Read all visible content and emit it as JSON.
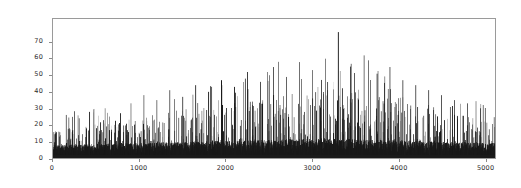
{
  "chart_data": {
    "type": "bar",
    "title": "",
    "xlabel": "",
    "ylabel": "",
    "xlim": [
      0,
      5120
    ],
    "ylim": [
      0,
      84
    ],
    "grid": false,
    "legend": null,
    "series_color": "#1a1a1a",
    "frame_color": "#9a9a9a",
    "background": "#ffffff",
    "xticks": [
      0,
      1000,
      2000,
      3000,
      4000,
      5000
    ],
    "xtick_labels": [
      "0",
      "1000",
      "2000",
      "3000",
      "4000",
      "5000"
    ],
    "yticks": [
      0,
      10,
      20,
      30,
      40,
      50,
      60,
      70
    ],
    "ytick_labels": [
      "0",
      "10",
      "20",
      "30",
      "40",
      "50",
      "60",
      "70"
    ],
    "n_points": 5120,
    "max_value": 76,
    "max_value_x": 3300,
    "noise_floor_range": [
      2,
      14
    ],
    "envelope_profile": {
      "x": [
        0,
        250,
        500,
        750,
        1000,
        1250,
        1500,
        1750,
        2000,
        2250,
        2500,
        2750,
        3000,
        3250,
        3500,
        3750,
        4000,
        4250,
        4500,
        4750,
        5000,
        5120
      ],
      "peak_envelope": [
        24,
        27,
        30,
        32,
        35,
        38,
        41,
        44,
        47,
        50,
        53,
        56,
        59,
        62,
        58,
        54,
        50,
        45,
        40,
        36,
        32,
        30
      ],
      "floor_envelope": [
        11,
        12,
        12,
        13,
        13,
        14,
        14,
        15,
        15,
        16,
        16,
        17,
        17,
        17,
        17,
        16,
        16,
        15,
        14,
        14,
        13,
        13
      ]
    },
    "notable_spikes": [
      {
        "x": 150,
        "y": 26
      },
      {
        "x": 300,
        "y": 24
      },
      {
        "x": 420,
        "y": 28
      },
      {
        "x": 600,
        "y": 30
      },
      {
        "x": 780,
        "y": 27
      },
      {
        "x": 900,
        "y": 33
      },
      {
        "x": 1050,
        "y": 38
      },
      {
        "x": 1200,
        "y": 35
      },
      {
        "x": 1350,
        "y": 41
      },
      {
        "x": 1500,
        "y": 37
      },
      {
        "x": 1650,
        "y": 44
      },
      {
        "x": 1800,
        "y": 40
      },
      {
        "x": 1950,
        "y": 47
      },
      {
        "x": 2100,
        "y": 43
      },
      {
        "x": 2250,
        "y": 52
      },
      {
        "x": 2400,
        "y": 46
      },
      {
        "x": 2550,
        "y": 55
      },
      {
        "x": 2700,
        "y": 49
      },
      {
        "x": 2850,
        "y": 58
      },
      {
        "x": 3000,
        "y": 53
      },
      {
        "x": 3150,
        "y": 60
      },
      {
        "x": 3300,
        "y": 76
      },
      {
        "x": 3450,
        "y": 57
      },
      {
        "x": 3600,
        "y": 62
      },
      {
        "x": 3750,
        "y": 51
      },
      {
        "x": 3900,
        "y": 55
      },
      {
        "x": 4050,
        "y": 47
      },
      {
        "x": 4200,
        "y": 44
      },
      {
        "x": 4350,
        "y": 41
      },
      {
        "x": 4500,
        "y": 38
      },
      {
        "x": 4650,
        "y": 35
      },
      {
        "x": 4800,
        "y": 33
      },
      {
        "x": 4950,
        "y": 30
      }
    ]
  }
}
